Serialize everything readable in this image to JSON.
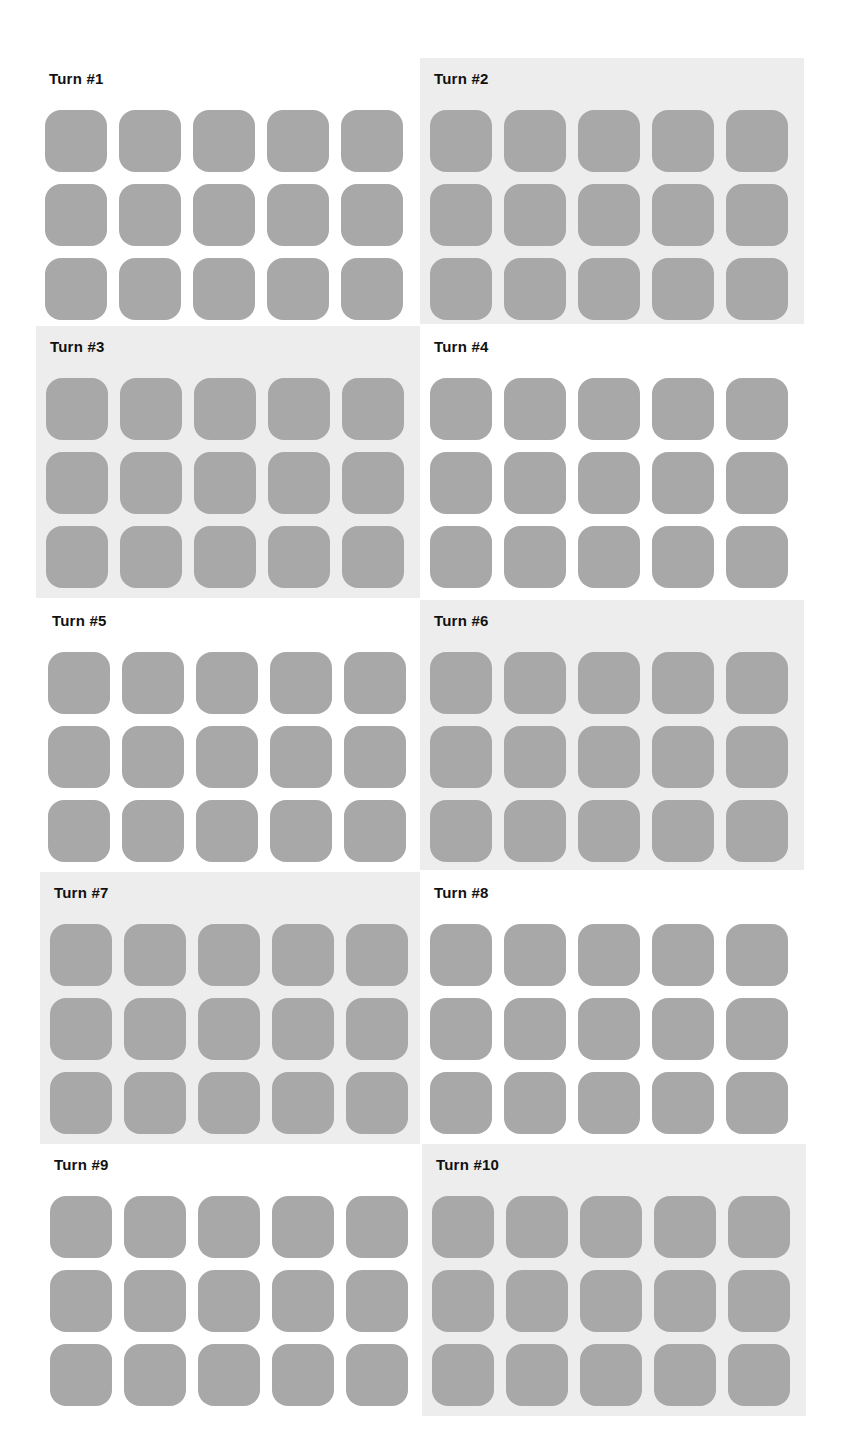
{
  "turns": [
    {
      "label": "Turn #1",
      "shaded": false,
      "x": 35,
      "y": 58,
      "w": 385,
      "h": 266
    },
    {
      "label": "Turn #2",
      "shaded": true,
      "x": 420,
      "y": 58,
      "w": 384,
      "h": 266
    },
    {
      "label": "Turn #3",
      "shaded": true,
      "x": 36,
      "y": 326,
      "w": 384,
      "h": 272
    },
    {
      "label": "Turn #4",
      "shaded": false,
      "x": 420,
      "y": 326,
      "w": 384,
      "h": 272
    },
    {
      "label": "Turn #5",
      "shaded": false,
      "x": 38,
      "y": 600,
      "w": 382,
      "h": 270
    },
    {
      "label": "Turn #6",
      "shaded": true,
      "x": 420,
      "y": 600,
      "w": 384,
      "h": 270
    },
    {
      "label": "Turn #7",
      "shaded": true,
      "x": 40,
      "y": 872,
      "w": 380,
      "h": 272
    },
    {
      "label": "Turn #8",
      "shaded": false,
      "x": 420,
      "y": 872,
      "w": 384,
      "h": 272
    },
    {
      "label": "Turn #9",
      "shaded": false,
      "x": 40,
      "y": 1144,
      "w": 382,
      "h": 272
    },
    {
      "label": "Turn #10",
      "shaded": true,
      "x": 422,
      "y": 1144,
      "w": 384,
      "h": 272
    }
  ],
  "grid": {
    "rows": 3,
    "cols": 5,
    "tile_color": "#a8a8a8"
  },
  "colors": {
    "shaded_bg": "#ededed",
    "plain_bg": "#ffffff",
    "title": "#111111"
  }
}
